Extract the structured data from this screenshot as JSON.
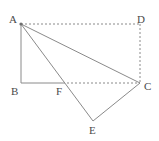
{
  "figure": {
    "width": 159,
    "height": 141,
    "background_color": "#ffffff",
    "stroke_color": "#8a8a8a",
    "label_color": "#4a4a4a",
    "points": {
      "A": {
        "label": "A",
        "x": 21,
        "y": 24,
        "label_x": 9,
        "label_y": 14
      },
      "B": {
        "label": "B",
        "x": 21,
        "y": 83,
        "label_x": 11,
        "label_y": 86
      },
      "C": {
        "label": "C",
        "x": 140,
        "y": 83,
        "label_x": 144,
        "label_y": 81
      },
      "D": {
        "label": "D",
        "x": 140,
        "y": 24,
        "label_x": 137,
        "label_y": 14
      },
      "E": {
        "label": "E",
        "x": 93,
        "y": 121,
        "label_x": 89,
        "label_y": 125
      },
      "F": {
        "label": "F",
        "x": 63,
        "y": 83,
        "label_x": 56,
        "label_y": 86
      }
    },
    "segments": [
      {
        "name": "segment-AD",
        "from": "A",
        "to": "D",
        "style": "dashed"
      },
      {
        "name": "segment-DC",
        "from": "D",
        "to": "C",
        "style": "dashed"
      },
      {
        "name": "segment-FC",
        "from": "F",
        "to": "C",
        "style": "dashed"
      },
      {
        "name": "segment-AB",
        "from": "A",
        "to": "B",
        "style": "solid"
      },
      {
        "name": "segment-BF",
        "from": "B",
        "to": "F",
        "style": "solid"
      },
      {
        "name": "segment-AC",
        "from": "A",
        "to": "C",
        "style": "solid"
      },
      {
        "name": "segment-AE",
        "from": "A",
        "to": "E",
        "style": "solid"
      },
      {
        "name": "segment-EC",
        "from": "E",
        "to": "C",
        "style": "solid"
      }
    ],
    "vertex_marker": {
      "point": "A",
      "radius": 1.6
    }
  }
}
